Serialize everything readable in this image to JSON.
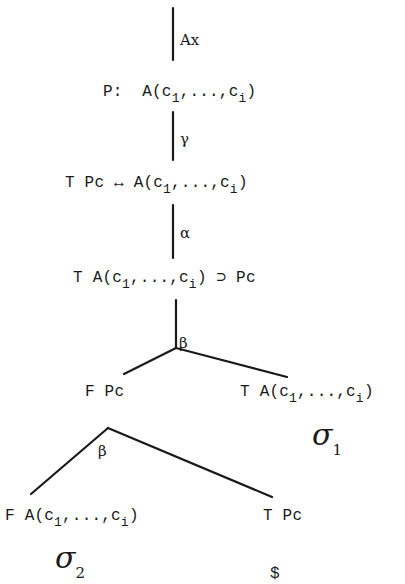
{
  "diagram": {
    "type": "semantic-tableau-tree",
    "nodes": {
      "root_rule": "Ax",
      "n1": {
        "prefix": "P:",
        "formula_head": "A(c",
        "sub1": "1",
        "mid": ",...,c",
        "sub2": "i",
        "tail": ")"
      },
      "rule1": "γ",
      "n2": {
        "prefix": "T Pc ↔",
        "formula_head": "A(c",
        "sub1": "1",
        "mid": ",...,c",
        "sub2": "i",
        "tail": ")"
      },
      "rule2": "α",
      "n3": {
        "prefix": "T",
        "formula_head": "A(c",
        "sub1": "1",
        "mid": ",...,c",
        "sub2": "i",
        "tail": ") ⊃ Pc"
      },
      "rule3": "β",
      "left": {
        "label": "F Pc"
      },
      "right": {
        "prefix": "T",
        "formula_head": "A(c",
        "sub1": "1",
        "mid": ",...,c",
        "sub2": "i",
        "tail": ")"
      },
      "right_marker": {
        "symbol": "σ",
        "sub": "1"
      },
      "rule4": "β",
      "left_left": {
        "prefix": "F",
        "formula_head": "A(c",
        "sub1": "1",
        "mid": ",...,c",
        "sub2": "i",
        "tail": ")"
      },
      "left_left_marker": {
        "symbol": "σ",
        "sub": "2"
      },
      "left_right": {
        "label": "T Pc"
      },
      "left_right_marker": "$"
    }
  }
}
